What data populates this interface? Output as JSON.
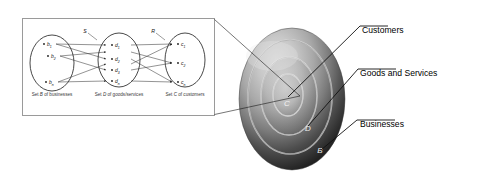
{
  "figure": {
    "background_color": "#ffffff"
  },
  "diagram_box": {
    "border_color": "#9a9a9a",
    "sets": [
      {
        "id": "B",
        "caption_prefix": "Set ",
        "caption_letter": "B",
        "caption_suffix": " of businesses",
        "elements": [
          {
            "base": "b",
            "sub": "1"
          },
          {
            "base": "b",
            "sub": "2"
          },
          {
            "base": "b",
            "sub": "n"
          }
        ]
      },
      {
        "id": "D",
        "caption_prefix": "Set ",
        "caption_letter": "D",
        "caption_suffix": " of goods/services",
        "elements": [
          {
            "base": "d",
            "sub": "1"
          },
          {
            "base": "d",
            "sub": "2"
          },
          {
            "base": "d",
            "sub": "3"
          },
          {
            "base": "d",
            "sub": "n"
          }
        ]
      },
      {
        "id": "C",
        "caption_prefix": "Set ",
        "caption_letter": "C",
        "caption_suffix": " of customers",
        "elements": [
          {
            "base": "c",
            "sub": "1"
          },
          {
            "base": "c",
            "sub": "2"
          },
          {
            "base": "c",
            "sub": "n"
          }
        ]
      }
    ],
    "relations": [
      {
        "label": "S",
        "from": "B",
        "to": "D"
      },
      {
        "label": "R",
        "from": "D",
        "to": "C"
      }
    ]
  },
  "sphere": {
    "ring_labels": [
      {
        "letter": "C",
        "ring": "inner"
      },
      {
        "letter": "D",
        "ring": "middle"
      },
      {
        "letter": "B",
        "ring": "outer"
      }
    ],
    "highlight_color": "#d8d8d8",
    "shadow_color": "#242424"
  },
  "callouts": [
    {
      "label": "Customers",
      "target": "C"
    },
    {
      "label": "Goods and Services",
      "target": "D"
    },
    {
      "label": "Businesses",
      "target": "B"
    }
  ]
}
